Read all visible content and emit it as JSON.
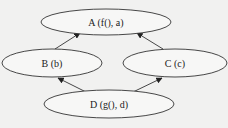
{
  "diagram": {
    "type": "directed-graph",
    "colors": {
      "background": "#f1f1f0",
      "stroke": "#333333",
      "node_fill": "#f7f7f6",
      "text": "#222222"
    },
    "nodes": [
      {
        "id": "A",
        "label": "A (f(),  a)",
        "cx": 106,
        "cy": 22,
        "rx": 65,
        "ry": 13
      },
      {
        "id": "B",
        "label": "B (b)",
        "cx": 52,
        "cy": 63,
        "rx": 50,
        "ry": 14
      },
      {
        "id": "C",
        "label": "C (c)",
        "cx": 175,
        "cy": 63,
        "rx": 52,
        "ry": 14
      },
      {
        "id": "D",
        "label": "D (g(),  d)",
        "cx": 109,
        "cy": 104,
        "rx": 65,
        "ry": 14
      }
    ],
    "edges": [
      {
        "from": "B",
        "to": "A",
        "x1": 55,
        "y1": 49,
        "x2": 80,
        "y2": 33
      },
      {
        "from": "C",
        "to": "A",
        "x1": 163,
        "y1": 49,
        "x2": 137,
        "y2": 33
      },
      {
        "from": "D",
        "to": "B",
        "x1": 86,
        "y1": 92,
        "x2": 58,
        "y2": 78
      },
      {
        "from": "D",
        "to": "C",
        "x1": 133,
        "y1": 92,
        "x2": 162,
        "y2": 78
      }
    ]
  }
}
